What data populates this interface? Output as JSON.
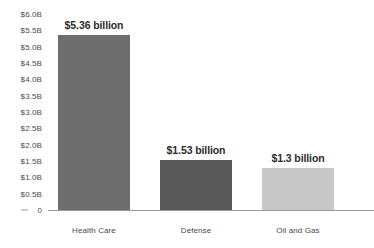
{
  "chart_data": {
    "type": "bar",
    "title": "",
    "subtitle": "",
    "xlabel": "",
    "ylabel": "",
    "categories": [
      "Health Care",
      "Defense",
      "Oil and Gas"
    ],
    "values": [
      5.36,
      1.53,
      1.3
    ],
    "value_labels": [
      "$5.36 billion",
      "$1.53 billion",
      "$1.3 billion"
    ],
    "bar_colors": [
      "#6e6e6e",
      "#585858",
      "#c8c8c8"
    ],
    "ylim": [
      0,
      6.0
    ],
    "ytick_values": [
      6.0,
      5.5,
      5.0,
      4.5,
      4.0,
      3.5,
      3.0,
      2.5,
      2.0,
      1.5,
      1.0,
      0.5,
      0
    ],
    "ytick_labels": [
      "$6.0B",
      "$5.5B",
      "$5.0B",
      "$4.5B",
      "$4.0B",
      "$3.5B",
      "$3.0B",
      "$2.5B",
      "$2.0B",
      "$1.5B",
      "$1.0B",
      "$0.5B",
      "0"
    ],
    "grid": false,
    "legend": false,
    "axis_color": "#9a9a9a",
    "tick_text_color": "#4a4a4a",
    "value_text_color": "#2b2b2b",
    "background_color": "#ffffff"
  }
}
